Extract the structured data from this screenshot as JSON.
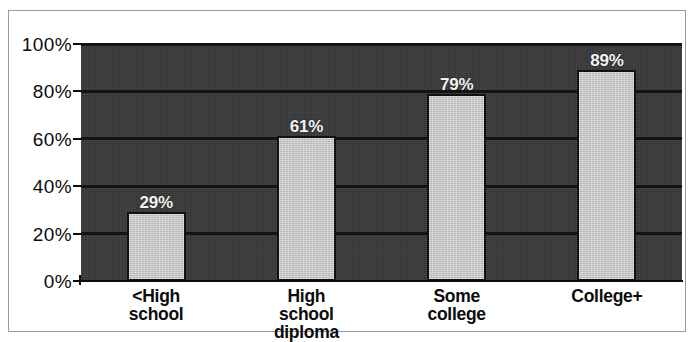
{
  "chart_data": {
    "type": "bar",
    "title": "",
    "xlabel": "",
    "ylabel": "",
    "categories": [
      "<High school",
      "High school diploma",
      "Some college",
      "College+"
    ],
    "category_lines": [
      [
        "<High",
        "school"
      ],
      [
        "High",
        "school",
        "diploma"
      ],
      [
        "Some",
        "college"
      ],
      [
        "College+"
      ]
    ],
    "values": [
      29,
      61,
      79,
      89
    ],
    "value_labels": [
      "29%",
      "61%",
      "79%",
      "89%"
    ],
    "ylim": [
      0,
      100
    ],
    "ytick_values": [
      0,
      20,
      40,
      60,
      80,
      100
    ],
    "ytick_labels": [
      "0%",
      "20%",
      "40%",
      "60%",
      "80%",
      "100%"
    ],
    "gridlines_at": [
      20,
      40,
      60,
      80,
      100
    ],
    "grid": true,
    "legend": "none",
    "colors": {
      "plot_background": "#3c3b3b",
      "bar_fill": "#c9c9c9",
      "bar_outline": "#111111",
      "gridline": "#141414",
      "value_label": "#f2f2f2",
      "axis_text": "#0c0c0c",
      "frame_border": "#9a9a9a",
      "page_background": "#ffffff"
    }
  }
}
